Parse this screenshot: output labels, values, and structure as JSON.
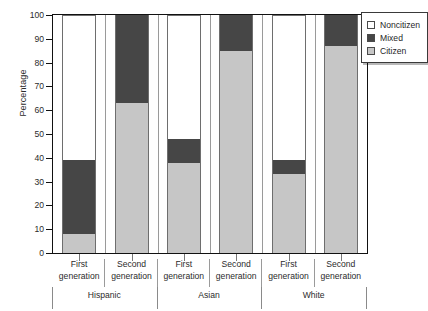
{
  "chart_data": {
    "type": "bar",
    "stacked": true,
    "title": "",
    "xlabel": "",
    "ylabel": "Percentage",
    "ylim": [
      0,
      100
    ],
    "ytick_step": 10,
    "yticks": [
      0,
      10,
      20,
      30,
      40,
      50,
      60,
      70,
      80,
      90,
      100
    ],
    "grid": false,
    "legend_position": "top-right-outside",
    "categories": [
      "Hispanic First generation",
      "Hispanic Second generation",
      "Asian First generation",
      "Asian Second generation",
      "White First generation",
      "White Second generation"
    ],
    "groups": [
      {
        "name": "Hispanic",
        "generations": [
          "First generation",
          "Second generation"
        ]
      },
      {
        "name": "Asian",
        "generations": [
          "First generation",
          "Second generation"
        ]
      },
      {
        "name": "White",
        "generations": [
          "First generation",
          "Second generation"
        ]
      }
    ],
    "series": [
      {
        "name": "Citizen",
        "color": "#c6c6c6",
        "values": [
          8,
          63,
          38,
          85,
          33,
          87
        ]
      },
      {
        "name": "Mixed",
        "color": "#464646",
        "values": [
          31,
          37,
          10,
          15,
          6,
          13
        ]
      },
      {
        "name": "Noncitizen",
        "color": "#ffffff",
        "values": [
          61,
          0,
          52,
          0,
          61,
          0
        ]
      }
    ],
    "bars": [
      {
        "category": "Hispanic First generation",
        "citizen": 8,
        "mixed_top": 39,
        "noncitizen_top": 100
      },
      {
        "category": "Hispanic Second generation",
        "citizen": 63,
        "mixed_top": 100,
        "noncitizen_top": 100
      },
      {
        "category": "Asian First generation",
        "citizen": 38,
        "mixed_top": 48,
        "noncitizen_top": 100
      },
      {
        "category": "Asian Second generation",
        "citizen": 85,
        "mixed_top": 100,
        "noncitizen_top": 100
      },
      {
        "category": "White First generation",
        "citizen": 33,
        "mixed_top": 39,
        "noncitizen_top": 100
      },
      {
        "category": "White Second generation",
        "citizen": 87,
        "mixed_top": 100,
        "noncitizen_top": 100
      }
    ]
  },
  "axis": {
    "y_title": "Percentage",
    "y_labels": [
      "0",
      "10",
      "20",
      "30",
      "40",
      "50",
      "60",
      "70",
      "80",
      "90",
      "100"
    ]
  },
  "legend": {
    "items": [
      {
        "label": "Noncitizen",
        "swatch": "noncitizen"
      },
      {
        "label": "Mixed",
        "swatch": "mixed"
      },
      {
        "label": "Citizen",
        "swatch": "citizen"
      }
    ]
  },
  "xaxis": {
    "generation_labels": [
      "First generation",
      "Second generation",
      "First generation",
      "Second generation",
      "First generation",
      "Second generation"
    ],
    "group_labels": [
      "Hispanic",
      "Asian",
      "White"
    ]
  }
}
